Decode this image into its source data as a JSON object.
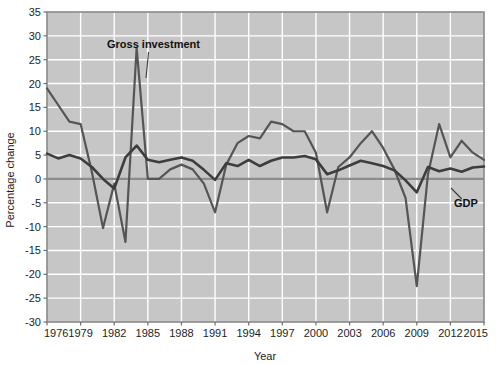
{
  "chart_data": {
    "type": "line",
    "title": "",
    "xlabel": "Year",
    "ylabel": "Percentage change",
    "xlim": [
      1976,
      2015
    ],
    "ylim": [
      -30,
      35
    ],
    "ytick_labels": [
      "35",
      "30",
      "25",
      "20",
      "15",
      "10",
      "5",
      "0",
      "-5",
      "-10",
      "-15",
      "-20",
      "-25",
      "-30"
    ],
    "ytick_values": [
      35,
      30,
      25,
      20,
      15,
      10,
      5,
      0,
      -5,
      -10,
      -15,
      -20,
      -25,
      -30
    ],
    "xtick_labels": [
      "1976",
      "1979",
      "1982",
      "1985",
      "1988",
      "1991",
      "1994",
      "1997",
      "2000",
      "2003",
      "2006",
      "2009",
      "2012",
      "2015"
    ],
    "xtick_values": [
      1976,
      1979,
      1982,
      1985,
      1988,
      1991,
      1994,
      1997,
      2000,
      2003,
      2006,
      2009,
      2012,
      2015
    ],
    "grid": true,
    "grid_color": "#ffffff",
    "plot_background": "#c6c6c6",
    "legend_position": "inline-annotation",
    "x": [
      1976,
      1977,
      1978,
      1979,
      1980,
      1981,
      1982,
      1983,
      1984,
      1985,
      1986,
      1987,
      1988,
      1989,
      1990,
      1991,
      1992,
      1993,
      1994,
      1995,
      1996,
      1997,
      1998,
      1999,
      2000,
      2001,
      2002,
      2003,
      2004,
      2005,
      2006,
      2007,
      2008,
      2009,
      2010,
      2011,
      2012,
      2013,
      2014,
      2015
    ],
    "series": [
      {
        "name": "Gross investment",
        "color": "#555555",
        "linewidth": 2.2,
        "values": [
          19.0,
          15.5,
          12.0,
          11.5,
          1.5,
          -10.3,
          -1.0,
          -13.2,
          27.5,
          0.0,
          0.0,
          2.0,
          3.0,
          2.0,
          -1.0,
          -7.0,
          3.0,
          7.5,
          9.0,
          8.5,
          12.0,
          11.5,
          10.0,
          10.0,
          5.5,
          -7.0,
          2.5,
          4.5,
          7.5,
          10.0,
          6.5,
          2.0,
          -4.0,
          -22.5,
          1.0,
          11.5,
          4.5,
          8.0,
          5.5,
          4.0
        ]
      },
      {
        "name": "GDP",
        "color": "#3d3d3d",
        "linewidth": 2.6,
        "values": [
          5.3,
          4.3,
          5.0,
          4.3,
          2.5,
          0.0,
          -2.0,
          4.5,
          7.0,
          4.0,
          3.5,
          4.0,
          4.5,
          3.8,
          1.9,
          -0.2,
          3.3,
          2.7,
          4.0,
          2.7,
          3.8,
          4.5,
          4.5,
          4.8,
          4.1,
          1.0,
          1.8,
          2.8,
          3.8,
          3.3,
          2.7,
          1.8,
          -0.3,
          -2.8,
          2.5,
          1.6,
          2.2,
          1.5,
          2.4,
          2.6
        ]
      }
    ],
    "annotations": [
      {
        "text": "Gross investment",
        "x_px": 107,
        "y_px": 48,
        "leader_to_x_px": 146,
        "leader_to_y_px": 78
      },
      {
        "text": "GDP",
        "x_px": 454,
        "y_px": 207,
        "leader_to_x_px": 451,
        "leader_to_y_px": 188
      }
    ],
    "zero_line": {
      "value": 0,
      "color": "#8c8c8c"
    }
  }
}
